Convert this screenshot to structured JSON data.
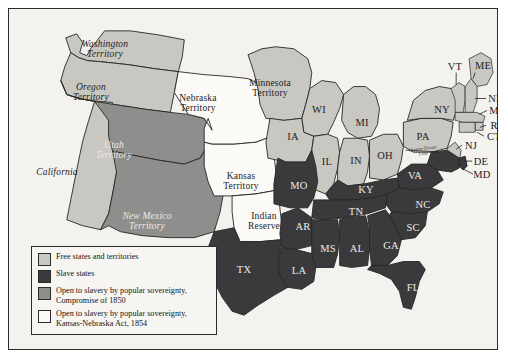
{
  "map": {
    "title": "United States 1854: Slave and Free States and Territories",
    "background_color": "#f4f2ee",
    "border_color": "#2b2b2b",
    "fill_colors": {
      "free": "#c9c7c2",
      "slave": "#3a3a3c",
      "compromise_1850": "#8e8e8c",
      "kansas_nebraska_1854": "#fbfaf7",
      "water": "#f4f2ee"
    },
    "annotations": [
      {
        "name": "mason-dixon-line",
        "text": "Mason-Dixon\nLine"
      }
    ],
    "regions": [
      {
        "name": "washington-territory",
        "label": "Washington\nTerritory",
        "category": "free",
        "style": "terr",
        "tone": "dark",
        "x": 96,
        "y": 40
      },
      {
        "name": "oregon-territory",
        "label": "Oregon\nTerritory",
        "category": "free",
        "style": "terr",
        "tone": "dark",
        "x": 82,
        "y": 83
      },
      {
        "name": "california",
        "label": "California",
        "category": "free",
        "style": "terr",
        "tone": "dark",
        "x": 48,
        "y": 163
      },
      {
        "name": "utah-territory",
        "label": "Utah\nTerritory",
        "category": "compromise_1850",
        "style": "terr",
        "tone": "light",
        "x": 105,
        "y": 141
      },
      {
        "name": "new-mexico-territory",
        "label": "New Mexico\nTerritory",
        "category": "compromise_1850",
        "style": "terr",
        "tone": "light",
        "x": 138,
        "y": 212
      },
      {
        "name": "nebraska-territory",
        "label": "Nebraska\nTerritory",
        "category": "kansas_nebraska_1854",
        "style": "terr-up",
        "tone": "dark",
        "x": 189,
        "y": 94
      },
      {
        "name": "kansas-territory",
        "label": "Kansas\nTerritory",
        "category": "kansas_nebraska_1854",
        "style": "terr-up",
        "tone": "dark",
        "x": 232,
        "y": 172
      },
      {
        "name": "indian-reserve",
        "label": "Indian\nReserve",
        "category": "kansas_nebraska_1854",
        "style": "terr-up",
        "tone": "dark",
        "x": 255,
        "y": 212
      },
      {
        "name": "minnesota-territory",
        "label": "Minnesota\nTerritory",
        "category": "free",
        "style": "terr-up",
        "tone": "dark",
        "x": 261,
        "y": 79
      },
      {
        "name": "wisconsin",
        "label": "WI",
        "category": "free",
        "style": "abbr",
        "tone": "dark",
        "x": 310,
        "y": 101
      },
      {
        "name": "iowa",
        "label": "IA",
        "category": "free",
        "style": "abbr",
        "tone": "dark",
        "x": 284,
        "y": 128
      },
      {
        "name": "illinois",
        "label": "IL",
        "category": "free",
        "style": "abbr",
        "tone": "dark",
        "x": 318,
        "y": 153
      },
      {
        "name": "michigan",
        "label": "MI",
        "category": "free",
        "style": "abbr",
        "tone": "dark",
        "x": 353,
        "y": 114
      },
      {
        "name": "indiana",
        "label": "IN",
        "category": "free",
        "style": "abbr",
        "tone": "dark",
        "x": 347,
        "y": 152
      },
      {
        "name": "ohio",
        "label": "OH",
        "category": "free",
        "style": "abbr",
        "tone": "dark",
        "x": 376,
        "y": 147
      },
      {
        "name": "pennsylvania",
        "label": "PA",
        "category": "free",
        "style": "abbr",
        "tone": "dark",
        "x": 414,
        "y": 128
      },
      {
        "name": "new-york",
        "label": "NY",
        "category": "free",
        "style": "abbr",
        "tone": "dark",
        "x": 433,
        "y": 101
      },
      {
        "name": "vermont",
        "label": "VT",
        "category": "free",
        "style": "abbr",
        "tone": "dark",
        "x": 446,
        "y": 58
      },
      {
        "name": "maine",
        "label": "ME",
        "category": "free",
        "style": "abbr",
        "tone": "dark",
        "x": 474,
        "y": 57
      },
      {
        "name": "new-hampshire",
        "label": "NH",
        "category": "free",
        "style": "abbr",
        "tone": "dark",
        "x": 487,
        "y": 90
      },
      {
        "name": "massachusetts",
        "label": "MA",
        "category": "free",
        "style": "abbr",
        "tone": "dark",
        "x": 489,
        "y": 102
      },
      {
        "name": "rhode-island",
        "label": "RI",
        "category": "free",
        "style": "abbr",
        "tone": "dark",
        "x": 487,
        "y": 117
      },
      {
        "name": "connecticut",
        "label": "CT",
        "category": "free",
        "style": "abbr",
        "tone": "dark",
        "x": 485,
        "y": 128
      },
      {
        "name": "new-jersey",
        "label": "NJ",
        "category": "free",
        "style": "abbr",
        "tone": "dark",
        "x": 462,
        "y": 137
      },
      {
        "name": "delaware",
        "label": "DE",
        "category": "slave",
        "style": "abbr",
        "tone": "dark",
        "x": 472,
        "y": 153
      },
      {
        "name": "maryland",
        "label": "MD",
        "category": "slave",
        "style": "abbr",
        "tone": "dark",
        "x": 473,
        "y": 166
      },
      {
        "name": "missouri",
        "label": "MO",
        "category": "slave",
        "style": "abbr",
        "tone": "light",
        "x": 290,
        "y": 177
      },
      {
        "name": "kentucky",
        "label": "KY",
        "category": "slave",
        "style": "abbr",
        "tone": "light",
        "x": 357,
        "y": 181
      },
      {
        "name": "virginia",
        "label": "VA",
        "category": "slave",
        "style": "abbr",
        "tone": "light",
        "x": 406,
        "y": 167
      },
      {
        "name": "north-carolina",
        "label": "NC",
        "category": "slave",
        "style": "abbr",
        "tone": "light",
        "x": 414,
        "y": 196
      },
      {
        "name": "tennessee",
        "label": "TN",
        "category": "slave",
        "style": "abbr",
        "tone": "light",
        "x": 347,
        "y": 203
      },
      {
        "name": "south-carolina",
        "label": "SC",
        "category": "slave",
        "style": "abbr",
        "tone": "light",
        "x": 404,
        "y": 219
      },
      {
        "name": "arkansas",
        "label": "AR",
        "category": "slave",
        "style": "abbr",
        "tone": "light",
        "x": 294,
        "y": 218
      },
      {
        "name": "mississippi",
        "label": "MS",
        "category": "slave",
        "style": "abbr",
        "tone": "light",
        "x": 319,
        "y": 240
      },
      {
        "name": "alabama",
        "label": "AL",
        "category": "slave",
        "style": "abbr",
        "tone": "light",
        "x": 348,
        "y": 240
      },
      {
        "name": "georgia",
        "label": "GA",
        "category": "slave",
        "style": "abbr",
        "tone": "light",
        "x": 382,
        "y": 237
      },
      {
        "name": "florida",
        "label": "FL",
        "category": "slave",
        "style": "abbr",
        "tone": "light",
        "x": 404,
        "y": 279
      },
      {
        "name": "louisiana",
        "label": "LA",
        "category": "slave",
        "style": "abbr",
        "tone": "light",
        "x": 290,
        "y": 262
      },
      {
        "name": "texas",
        "label": "TX",
        "category": "slave",
        "style": "abbr",
        "tone": "light",
        "x": 235,
        "y": 261
      }
    ]
  },
  "legend": {
    "items": [
      {
        "name": "legend-free-states",
        "swatch": "#c9c7c2",
        "text": "Free states and territories"
      },
      {
        "name": "legend-slave-states",
        "swatch": "#3a3a3c",
        "text": "Slave states"
      },
      {
        "name": "legend-compromise-1850",
        "swatch": "#8e8e8c",
        "text": "Open to slavery by popular sovereignty,\nCompromise of 1850"
      },
      {
        "name": "legend-kansas-nebraska",
        "swatch": "#fbfaf7",
        "text": "Open to slavery by popular sovereignty,\nKansas-Nebraska Act, 1854"
      }
    ]
  }
}
